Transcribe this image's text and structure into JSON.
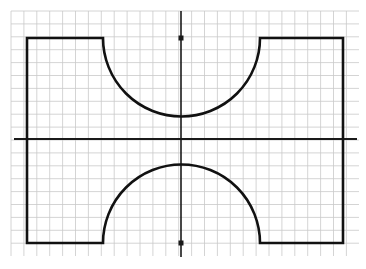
{
  "document": {
    "title": "Technical Drawing — Concave Arc Profile",
    "background_color": "#ffffff",
    "width": 366,
    "height": 269
  },
  "grid": {
    "name": "graph-paper-grid",
    "line_color": "#c9c9c9",
    "line_width": 0.8,
    "spacing": 12.9,
    "origin_x": 11,
    "origin_y": 11,
    "columns": 27,
    "rows": 19,
    "extent_x_start": 11,
    "extent_x_end": 359,
    "extent_y_start": 11,
    "extent_y_end": 256
  },
  "axes": {
    "stroke_color": "#1a1a1a",
    "horizontal_centerline": {
      "name": "horizontal-centerline",
      "y": 139,
      "x_start": 14,
      "x_end": 357,
      "width": 2.2
    },
    "vertical_centerline": {
      "name": "vertical-centerline",
      "x": 181,
      "y_start": 11,
      "y_end": 257,
      "width": 1.6
    },
    "markers": [
      {
        "name": "top-center-marker",
        "x": 181,
        "y": 38,
        "size": 5
      },
      {
        "name": "bottom-center-marker",
        "x": 181,
        "y": 243,
        "size": 5
      }
    ]
  },
  "profile": {
    "name": "part-outline",
    "stroke_color": "#111111",
    "stroke_width": 2.6,
    "fill": "none",
    "left_x": 27,
    "right_x": 343,
    "top_y": 38,
    "bottom_y": 243,
    "arc_left_x": 103,
    "arc_right_x": 260,
    "upper_arc_depth_y": 117,
    "lower_arc_depth_y": 160,
    "arc_radius": 78.5,
    "path": "M 27 38 L 103 38 A 78.5 78.5 0 0 0 260 38 L 343 38 L 343 243 L 260 243 A 78.5 78.5 0 0 0 103 243 L 27 243 Z"
  },
  "labels": {
    "caption": "",
    "dimension_texts": []
  }
}
